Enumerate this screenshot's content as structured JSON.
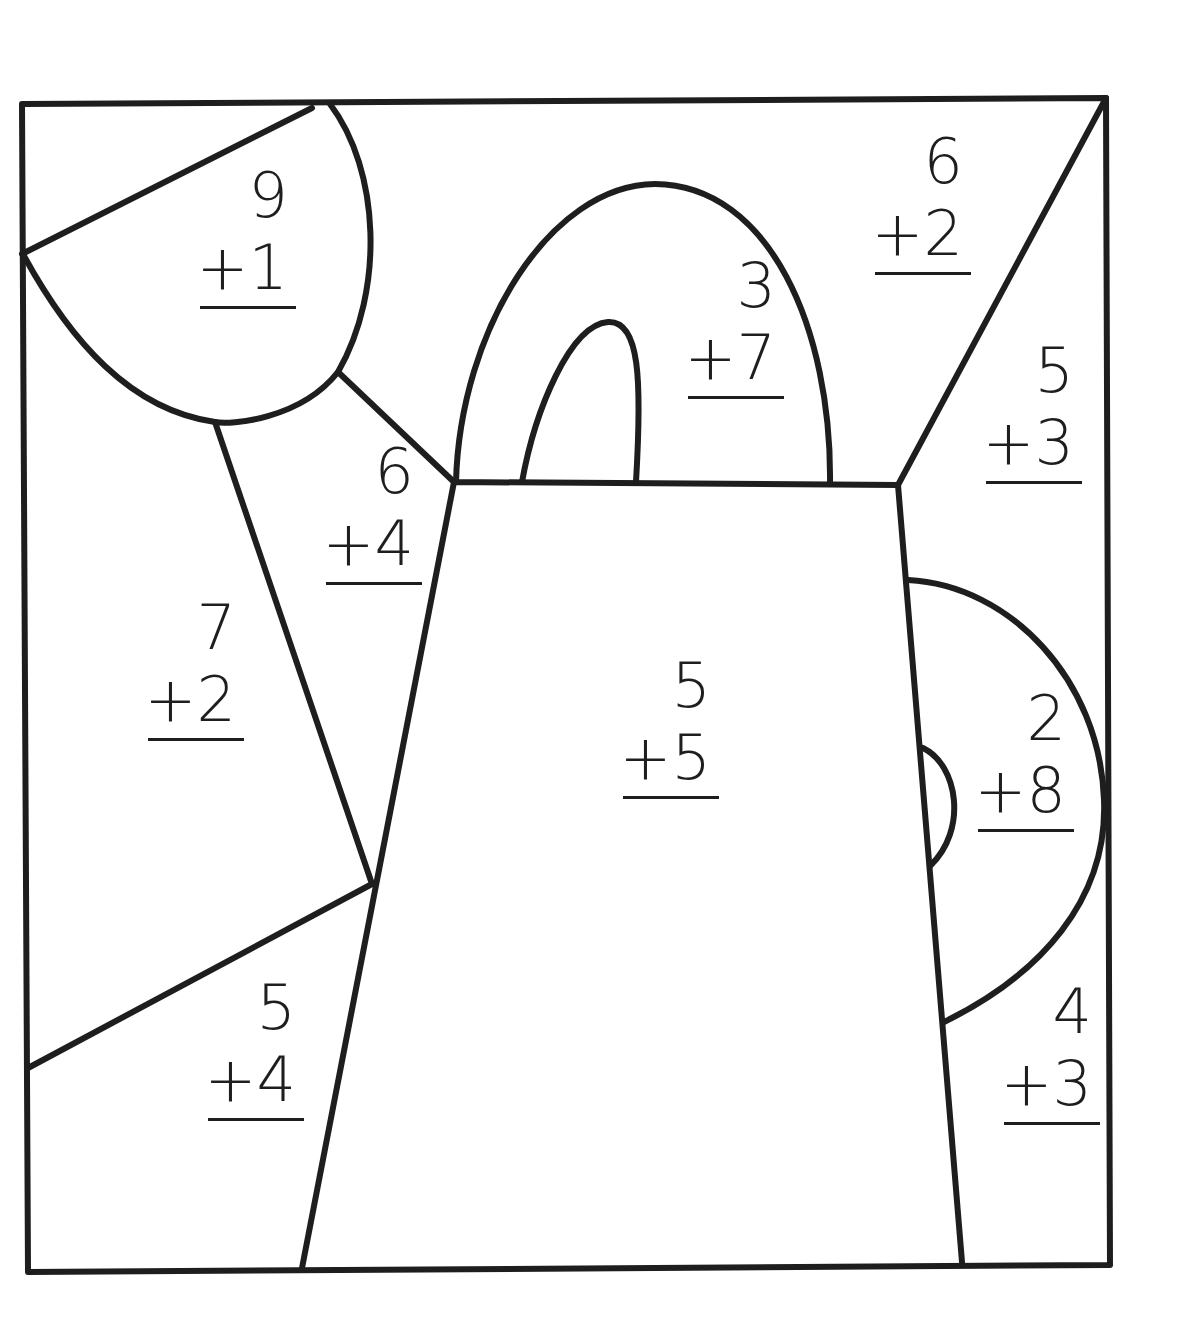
{
  "worksheet": {
    "title": "",
    "line_color": "#1e1e1e",
    "background": "#ffffff",
    "problems": [
      {
        "id": "sun",
        "top": "9",
        "bottom": "+1",
        "x": 220,
        "y": 160
      },
      {
        "id": "handle",
        "top": "3",
        "bottom": "+7",
        "x": 715,
        "y": 245
      },
      {
        "id": "sky-top-right",
        "top": "6",
        "bottom": "+2",
        "x": 900,
        "y": 120
      },
      {
        "id": "spout-right",
        "top": "5",
        "bottom": "+3",
        "x": 1015,
        "y": 330
      },
      {
        "id": "ray-middle",
        "top": "6",
        "bottom": "+4",
        "x": 355,
        "y": 430
      },
      {
        "id": "left-side",
        "top": "7",
        "bottom": "+2",
        "x": 175,
        "y": 585
      },
      {
        "id": "can-body",
        "top": "5",
        "bottom": "+5",
        "x": 650,
        "y": 645
      },
      {
        "id": "side-handle",
        "top": "2",
        "bottom": "+8",
        "x": 1005,
        "y": 675
      },
      {
        "id": "bottom-left",
        "top": "5",
        "bottom": "+4",
        "x": 238,
        "y": 965
      },
      {
        "id": "bottom-right",
        "top": "4",
        "bottom": "+3",
        "x": 1033,
        "y": 970
      }
    ]
  }
}
